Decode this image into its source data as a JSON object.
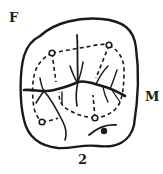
{
  "figure": {
    "number_label": "2",
    "orientation_labels": {
      "top_left": "F",
      "right": "M"
    },
    "elements": {
      "outline": "solid closed contour",
      "fissures": "solid branching dark lines",
      "cusp_ridges": "dashed lines",
      "cusp_tips": "small circles on dashed lines",
      "pit": "filled black dot with curved mark"
    },
    "colors": {
      "ink": "#1a1a1a",
      "background": "#ffffff"
    }
  }
}
